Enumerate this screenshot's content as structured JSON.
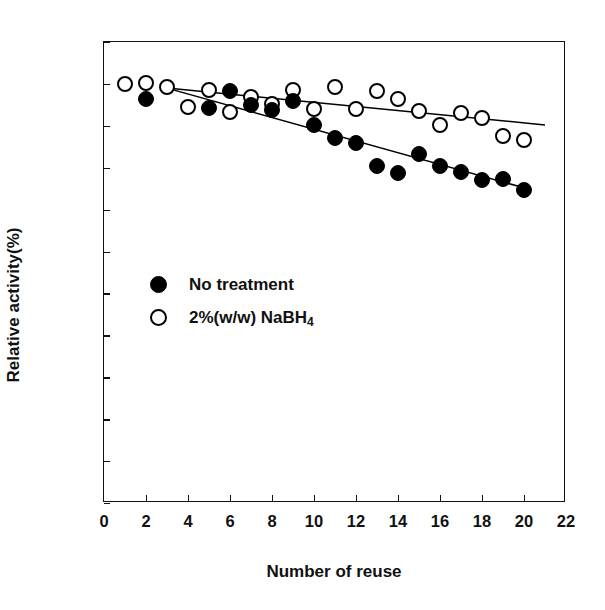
{
  "chart_data": {
    "type": "scatter",
    "title": "",
    "xlabel": "Number of reuse",
    "ylabel": "Relative activity(%)",
    "xlim": [
      0,
      22
    ],
    "ylim": [
      0,
      110
    ],
    "xticks": [
      0,
      2,
      4,
      6,
      8,
      10,
      12,
      14,
      16,
      18,
      20,
      22
    ],
    "yticks": [
      0,
      10,
      20,
      30,
      40,
      50,
      60,
      70,
      80,
      90,
      100,
      110
    ],
    "xtick_labels": [
      "0",
      "2",
      "4",
      "6",
      "8",
      "10",
      "12",
      "14",
      "16",
      "18",
      "20",
      "22"
    ],
    "ytick_labels": [
      "0",
      "10",
      "20",
      "30",
      "40",
      "50",
      "60",
      "70",
      "80",
      "90",
      "100",
      "110"
    ],
    "grid": false,
    "legend_position": "center-left",
    "series": [
      {
        "name": "No treatment",
        "marker": "filled-circle",
        "color": "#000000",
        "x": [
          2,
          5,
          6,
          7,
          8,
          9,
          10,
          11,
          12,
          13,
          14,
          15,
          16,
          17,
          18,
          19,
          20
        ],
        "y": [
          96.4,
          94.2,
          98.3,
          95.0,
          93.8,
          96.0,
          90.3,
          87.2,
          85.8,
          80.4,
          78.8,
          83.3,
          80.3,
          78.9,
          77.0,
          77.4,
          74.7
        ],
        "trendline": {
          "x": [
            3,
            20
          ],
          "y": [
            99.0,
            75.2
          ]
        }
      },
      {
        "name": "2%(w/w) NaBH4",
        "marker": "open-circle",
        "color": "#000000",
        "x": [
          1,
          2,
          3,
          4,
          5,
          6,
          7,
          8,
          9,
          10,
          11,
          12,
          13,
          14,
          15,
          16,
          17,
          18,
          19,
          20
        ],
        "y": [
          100.0,
          100.2,
          99.3,
          94.5,
          98.5,
          93.4,
          96.8,
          95.3,
          98.6,
          94.1,
          99.3,
          94.1,
          98.2,
          96.4,
          93.5,
          90.1,
          93.0,
          91.9,
          87.5,
          86.5
        ],
        "trendline": {
          "x": [
            3,
            21
          ],
          "y": [
            99.0,
            90.2
          ]
        }
      }
    ]
  },
  "legend": {
    "items": [
      {
        "label": "No treatment",
        "marker": "filled-circle"
      },
      {
        "label": "2%(w/w) NaBH",
        "sub": "4",
        "marker": "open-circle"
      }
    ]
  }
}
